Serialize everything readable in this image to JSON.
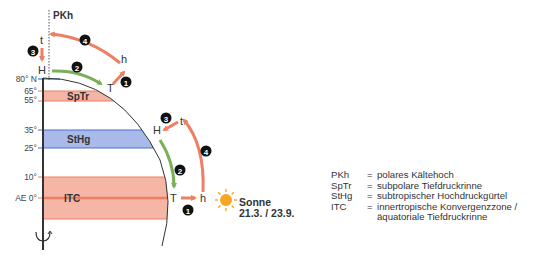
{
  "diagram": {
    "axis_label": "PKh",
    "latitudes": [
      {
        "label": "80° N",
        "y": 79
      },
      {
        "label": "65°",
        "y": 91
      },
      {
        "label": "55°",
        "y": 100
      },
      {
        "label": "35°",
        "y": 130
      },
      {
        "label": "25°",
        "y": 148
      },
      {
        "label": "10°",
        "y": 178
      },
      {
        "label": "AE 0°",
        "y": 198
      }
    ],
    "zones": [
      {
        "label": "SpTr",
        "from": "55°",
        "to": "65°",
        "color": "#f4b4a6"
      },
      {
        "label": "StHg",
        "from": "25°",
        "to": "35°",
        "color": "#a9b9ea"
      },
      {
        "label": "ITC",
        "from": "-10°",
        "to": "10°",
        "color": "#f5b6a6"
      }
    ],
    "polar_cell": {
      "top_left": "t",
      "bottom_left": "H",
      "bottom_right": "T",
      "top_right": "h",
      "steps": [
        "1",
        "2",
        "3",
        "4"
      ]
    },
    "equatorial_cell": {
      "top_left": "H",
      "top_right": "t",
      "bottom_left": "T",
      "bottom_right": "h",
      "steps": [
        "1",
        "2",
        "3",
        "4"
      ]
    },
    "sun": {
      "label": "Sonne",
      "dates": "21.3. / 23.9.",
      "color": "#f6a623"
    },
    "colors": {
      "warm_arrow": "#ef7f63",
      "cool_arrow": "#7ab05a",
      "earth_outline": "#333333",
      "latitude_line_blue": "#5b9bd5"
    }
  },
  "legend": [
    {
      "abbr": "PKh",
      "eq": "=",
      "text": "polares Kältehoch"
    },
    {
      "abbr": "SpTr",
      "eq": "=",
      "text": "subpolare Tiefdruckrinne"
    },
    {
      "abbr": "StHg",
      "eq": "=",
      "text": "subtropischer Hochdruckgürtel"
    },
    {
      "abbr": "ITC",
      "eq": "=",
      "text": "innertropische Konvergenzzone /"
    },
    {
      "abbr": "",
      "eq": "",
      "text": "äquatoriale Tiefdruckrinne"
    }
  ]
}
